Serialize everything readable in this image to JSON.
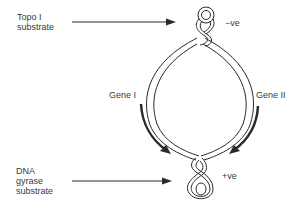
{
  "diagram": {
    "labels": {
      "topo_line1": "Topo I",
      "topo_line2": "substrate",
      "neg": "−ve",
      "gene1": "Gene I",
      "gene2": "Gene II",
      "gyr_line1": "DNA",
      "gyr_line2": "gyrase",
      "gyr_line3": "substrate",
      "pos": "+ve"
    },
    "colors": {
      "stroke": "#2a2a2a",
      "text": "#3a3a3a",
      "background": "#ffffff"
    }
  }
}
